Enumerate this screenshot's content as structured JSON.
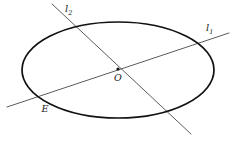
{
  "figure": {
    "background_color": "#ffffff",
    "width": 233,
    "height": 142,
    "ellipse": {
      "name": "ellipse-outline",
      "center_x": 118,
      "center_y": 70,
      "radius_x": 96,
      "radius_y": 48,
      "stroke_color": "#111111",
      "stroke_width": 1.7,
      "fill": "none"
    },
    "lines": [
      {
        "id": "l1",
        "label": "l",
        "subscript": "1",
        "x1": 7,
        "y1": 107,
        "x2": 229,
        "y2": 33,
        "stroke_color": "#4a4a4a",
        "stroke_width": 0.9,
        "label_x": 206,
        "label_y": 31
      },
      {
        "id": "l2",
        "label": "l",
        "subscript": "2",
        "x1": 52,
        "y1": 4,
        "x2": 191,
        "y2": 134,
        "stroke_color": "#4a4a4a",
        "stroke_width": 0.9,
        "label_x": 65,
        "label_y": 12
      }
    ],
    "points": [
      {
        "id": "O",
        "label": "O",
        "x": 118,
        "y": 69,
        "label_x": 118,
        "label_y": 81,
        "marker": true,
        "marker_radius": 1.6,
        "marker_color": "#111111"
      },
      {
        "id": "E",
        "label": "E",
        "x": 44,
        "y": 98,
        "label_x": 45,
        "label_y": 112,
        "marker": false,
        "marker_radius": 0,
        "marker_color": "#111111"
      }
    ]
  }
}
